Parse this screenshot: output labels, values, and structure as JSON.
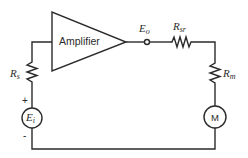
{
  "diagram": {
    "type": "circuit-schematic",
    "components": {
      "amplifier": {
        "label": "Amplifier"
      },
      "output_terminal": {
        "label_main": "E",
        "label_sub": "o"
      },
      "series_resistor": {
        "label_main": "R",
        "label_sub": "sr"
      },
      "meter_resistor": {
        "label_main": "R",
        "label_sub": "m"
      },
      "source_resistor": {
        "label_main": "R",
        "label_sub": "s"
      },
      "source": {
        "label_main": "E",
        "label_sub": "i",
        "plus": "+",
        "minus": "-"
      },
      "meter": {
        "label": "M"
      }
    },
    "colors": {
      "line": "#2b2b2b",
      "background": "#ffffff"
    }
  }
}
